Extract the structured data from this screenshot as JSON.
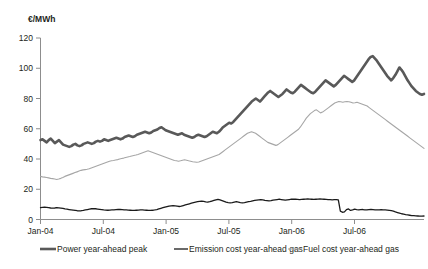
{
  "chart_data": {
    "type": "line",
    "title": "",
    "subtitle": "",
    "xlabel": "",
    "ylabel": "€/MWh",
    "ylim": [
      0,
      120
    ],
    "yticks": [
      0,
      20,
      40,
      60,
      80,
      100,
      120
    ],
    "xticks": [
      "Jan-04",
      "Jul-04",
      "Jan-05",
      "Jul-05",
      "Jan-06",
      "Jul-06"
    ],
    "xlim": [
      "Jan-04",
      "Dec-06"
    ],
    "grid": false,
    "legend_position": "bottom",
    "series": [
      {
        "name": "Power year-ahead peak",
        "color": "#595959",
        "width": 2.6,
        "values": [
          52.5,
          53.0,
          52.0,
          51.0,
          52.5,
          53.5,
          52.0,
          50.5,
          51.5,
          52.5,
          51.0,
          49.5,
          49.0,
          48.5,
          48.0,
          48.5,
          49.5,
          50.0,
          49.0,
          48.5,
          49.0,
          50.0,
          50.5,
          51.0,
          50.5,
          50.0,
          50.5,
          51.5,
          52.0,
          51.5,
          52.0,
          53.0,
          52.5,
          52.0,
          52.5,
          53.0,
          53.5,
          54.0,
          53.5,
          53.0,
          53.5,
          54.5,
          55.0,
          55.5,
          55.0,
          54.5,
          55.0,
          56.0,
          56.5,
          57.0,
          57.5,
          58.0,
          57.5,
          57.0,
          57.5,
          58.5,
          59.0,
          59.5,
          60.5,
          61.0,
          60.0,
          59.0,
          58.5,
          58.0,
          57.5,
          57.0,
          56.5,
          56.0,
          56.5,
          57.0,
          56.0,
          55.5,
          55.0,
          54.5,
          54.0,
          54.5,
          55.5,
          56.0,
          55.5,
          55.0,
          54.5,
          55.0,
          56.0,
          57.0,
          58.0,
          57.5,
          57.0,
          58.0,
          59.5,
          61.0,
          62.0,
          63.0,
          64.0,
          63.5,
          64.5,
          66.0,
          67.5,
          69.0,
          70.5,
          72.0,
          73.5,
          75.0,
          76.5,
          78.0,
          79.0,
          80.0,
          79.0,
          78.0,
          79.5,
          81.0,
          82.5,
          84.0,
          85.0,
          84.0,
          83.0,
          82.0,
          81.0,
          82.0,
          83.0,
          84.5,
          86.0,
          85.0,
          84.0,
          83.5,
          84.5,
          86.0,
          87.5,
          89.0,
          88.0,
          87.0,
          86.0,
          85.0,
          84.0,
          83.5,
          84.5,
          86.0,
          87.5,
          89.0,
          90.5,
          92.0,
          91.0,
          90.0,
          89.0,
          88.0,
          89.0,
          90.5,
          92.0,
          93.5,
          95.0,
          94.0,
          93.0,
          92.0,
          91.0,
          92.0,
          94.0,
          96.0,
          98.0,
          100.0,
          102.0,
          104.0,
          106.0,
          107.5,
          108.0,
          106.5,
          105.0,
          103.0,
          101.0,
          99.0,
          97.0,
          95.0,
          93.5,
          92.0,
          93.5,
          95.5,
          98.0,
          100.5,
          99.0,
          97.0,
          94.5,
          92.0,
          90.0,
          88.0,
          86.5,
          85.0,
          84.0,
          83.0,
          82.5,
          83.0
        ]
      },
      {
        "name": "Emission cost year-ahead gas",
        "color": "#1a1a1a",
        "width": 1.3,
        "values": [
          7.8,
          8.0,
          8.2,
          8.0,
          7.8,
          7.6,
          7.5,
          7.6,
          7.8,
          7.7,
          7.5,
          7.3,
          7.0,
          6.8,
          6.6,
          6.4,
          6.2,
          6.0,
          5.8,
          5.7,
          5.8,
          6.0,
          6.3,
          6.6,
          6.9,
          7.1,
          7.2,
          7.1,
          6.9,
          6.7,
          6.5,
          6.3,
          6.2,
          6.1,
          6.2,
          6.3,
          6.4,
          6.5,
          6.6,
          6.6,
          6.5,
          6.4,
          6.3,
          6.2,
          6.1,
          6.0,
          6.0,
          6.1,
          6.2,
          6.3,
          6.3,
          6.2,
          6.1,
          6.0,
          6.0,
          6.1,
          6.3,
          6.6,
          7.0,
          7.4,
          7.8,
          8.2,
          8.5,
          8.8,
          9.0,
          9.2,
          9.0,
          8.8,
          8.6,
          8.8,
          9.2,
          9.6,
          10.0,
          10.4,
          10.8,
          11.2,
          11.5,
          11.8,
          12.0,
          12.2,
          12.0,
          11.7,
          11.5,
          11.8,
          12.2,
          12.6,
          13.0,
          13.3,
          13.0,
          12.5,
          12.0,
          11.5,
          11.2,
          11.0,
          11.2,
          11.5,
          11.8,
          11.5,
          11.2,
          11.0,
          11.2,
          11.5,
          11.8,
          12.0,
          12.3,
          12.6,
          12.8,
          13.0,
          13.2,
          13.0,
          12.7,
          12.5,
          12.3,
          12.5,
          12.8,
          13.0,
          13.2,
          13.4,
          13.2,
          13.0,
          12.8,
          13.0,
          13.2,
          13.4,
          13.5,
          13.4,
          13.3,
          13.2,
          13.3,
          13.4,
          13.5,
          13.6,
          13.5,
          13.4,
          13.3,
          13.4,
          13.5,
          13.6,
          13.5,
          13.4,
          13.3,
          13.2,
          13.1,
          13.0,
          13.1,
          13.2,
          13.0,
          5.5,
          4.8,
          5.0,
          6.5,
          7.0,
          6.0,
          6.3,
          6.8,
          6.5,
          6.3,
          6.5,
          6.6,
          6.4,
          6.3,
          6.5,
          6.6,
          6.5,
          6.4,
          6.3,
          6.4,
          6.5,
          6.4,
          6.3,
          6.2,
          6.0,
          5.8,
          5.5,
          5.0,
          4.6,
          4.2,
          3.8,
          3.5,
          3.2,
          3.0,
          2.8,
          2.6,
          2.5,
          2.4,
          2.3,
          2.2,
          2.2,
          2.3
        ]
      },
      {
        "name": "Fuel cost year-ahead gas",
        "color": "#a6a6a6",
        "width": 1.1,
        "values": [
          28.5,
          28.2,
          28.0,
          27.8,
          27.5,
          27.2,
          27.0,
          26.8,
          26.5,
          26.8,
          27.2,
          27.8,
          28.5,
          29.0,
          29.5,
          30.0,
          30.5,
          31.0,
          31.5,
          32.0,
          32.5,
          32.8,
          33.0,
          33.2,
          33.5,
          34.0,
          34.5,
          35.0,
          35.5,
          36.0,
          36.5,
          37.0,
          37.5,
          38.0,
          38.5,
          38.8,
          39.0,
          39.3,
          39.6,
          40.0,
          40.3,
          40.6,
          41.0,
          41.3,
          41.6,
          42.0,
          42.3,
          42.6,
          43.0,
          43.5,
          44.0,
          44.5,
          45.0,
          45.5,
          45.0,
          44.5,
          44.0,
          43.5,
          43.0,
          42.5,
          42.0,
          41.5,
          41.0,
          40.5,
          40.0,
          39.5,
          39.0,
          38.8,
          38.5,
          38.8,
          39.2,
          39.5,
          39.2,
          38.8,
          38.5,
          38.2,
          38.0,
          37.8,
          38.0,
          38.5,
          39.0,
          39.5,
          40.0,
          40.5,
          41.0,
          41.5,
          42.0,
          42.5,
          43.0,
          44.0,
          45.0,
          46.0,
          47.0,
          48.0,
          49.0,
          50.0,
          51.0,
          52.0,
          53.0,
          54.0,
          55.0,
          56.0,
          57.0,
          57.5,
          58.0,
          57.5,
          57.0,
          56.0,
          55.0,
          54.0,
          53.0,
          52.0,
          51.0,
          50.5,
          50.0,
          49.5,
          49.0,
          49.5,
          50.5,
          51.5,
          52.5,
          53.5,
          54.5,
          55.5,
          56.5,
          57.5,
          58.5,
          59.5,
          61.0,
          63.0,
          65.0,
          67.0,
          68.5,
          70.0,
          71.0,
          72.0,
          72.5,
          71.5,
          70.5,
          71.0,
          72.0,
          73.0,
          74.0,
          75.0,
          76.0,
          77.0,
          77.5,
          78.0,
          77.8,
          77.5,
          77.8,
          78.0,
          77.8,
          77.5,
          77.0,
          77.2,
          77.5,
          77.0,
          76.5,
          76.0,
          75.5,
          75.0,
          74.0,
          73.0,
          72.0,
          71.0,
          70.0,
          69.0,
          68.0,
          67.0,
          66.0,
          65.0,
          64.0,
          63.0,
          62.0,
          61.0,
          60.0,
          59.0,
          58.0,
          57.0,
          56.0,
          55.0,
          54.0,
          53.0,
          52.0,
          51.0,
          50.0,
          49.0,
          48.0,
          47.0
        ]
      }
    ]
  },
  "legend": {
    "items": [
      {
        "label": "Power year-ahead peak",
        "marker": "thick-line-marker"
      },
      {
        "label": "Emission cost year-ahead gas",
        "marker": "medium-line-marker"
      },
      {
        "label": "Fuel cost year-ahead gas",
        "marker": "thin-line-marker"
      }
    ]
  }
}
